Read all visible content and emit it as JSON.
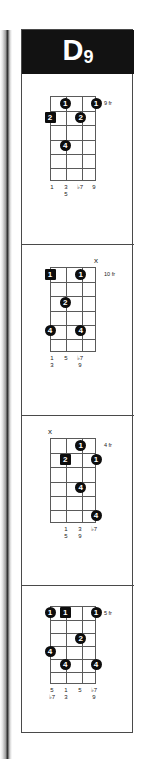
{
  "chord": {
    "root": "D",
    "extension": "9",
    "full_name": "D9"
  },
  "colors": {
    "banner_bg": "#121212",
    "banner_text": "#ffffff",
    "grid_line": "#5a5a5a",
    "dot_fill": "#0d0d0d",
    "dot_text": "#ffffff",
    "card_border": "#4a4a4a",
    "page_bg": "#ffffff"
  },
  "diagram_config": {
    "strings": 4,
    "frets": 6,
    "string_labels": [
      "4",
      "3",
      "2",
      "1"
    ]
  },
  "voicings": [
    {
      "id": "voicing-1",
      "fret_label": "9 fr",
      "top_markers": [
        "",
        "",
        "",
        ""
      ],
      "dots": [
        {
          "string": 2,
          "fret": 1,
          "finger": "1",
          "shape": "circle"
        },
        {
          "string": 4,
          "fret": 1,
          "finger": "1",
          "shape": "circle"
        },
        {
          "string": 1,
          "fret": 2,
          "finger": "2",
          "shape": "square"
        },
        {
          "string": 3,
          "fret": 2,
          "finger": "2",
          "shape": "circle"
        },
        {
          "string": 2,
          "fret": 4,
          "finger": "4",
          "shape": "circle"
        }
      ],
      "intervals": [
        {
          "top": "1",
          "bottom": ""
        },
        {
          "top": "3",
          "bottom": "5"
        },
        {
          "top": "♭7",
          "bottom": ""
        },
        {
          "top": "9",
          "bottom": ""
        }
      ]
    },
    {
      "id": "voicing-2",
      "fret_label": "10 fr",
      "top_markers": [
        "",
        "",
        "",
        "x"
      ],
      "dots": [
        {
          "string": 1,
          "fret": 1,
          "finger": "1",
          "shape": "square"
        },
        {
          "string": 3,
          "fret": 1,
          "finger": "1",
          "shape": "circle"
        },
        {
          "string": 2,
          "fret": 3,
          "finger": "2",
          "shape": "circle"
        },
        {
          "string": 1,
          "fret": 5,
          "finger": "4",
          "shape": "circle"
        },
        {
          "string": 3,
          "fret": 5,
          "finger": "4",
          "shape": "circle"
        }
      ],
      "intervals": [
        {
          "top": "1",
          "bottom": "3"
        },
        {
          "top": "5",
          "bottom": ""
        },
        {
          "top": "♭7",
          "bottom": "9"
        },
        {
          "top": "",
          "bottom": ""
        }
      ]
    },
    {
      "id": "voicing-3",
      "fret_label": "4 fr",
      "top_markers": [
        "x",
        "",
        "",
        ""
      ],
      "dots": [
        {
          "string": 3,
          "fret": 1,
          "finger": "1",
          "shape": "circle"
        },
        {
          "string": 2,
          "fret": 2,
          "finger": "2",
          "shape": "square"
        },
        {
          "string": 4,
          "fret": 2,
          "finger": "1",
          "shape": "circle"
        },
        {
          "string": 3,
          "fret": 4,
          "finger": "4",
          "shape": "circle"
        },
        {
          "string": 4,
          "fret": 6,
          "finger": "4",
          "shape": "circle"
        }
      ],
      "intervals": [
        {
          "top": "",
          "bottom": ""
        },
        {
          "top": "1",
          "bottom": "5"
        },
        {
          "top": "3",
          "bottom": "9"
        },
        {
          "top": "♭7",
          "bottom": ""
        }
      ]
    },
    {
      "id": "voicing-4",
      "fret_label": "5 fr",
      "top_markers": [
        "",
        "",
        "",
        ""
      ],
      "dots": [
        {
          "string": 1,
          "fret": 1,
          "finger": "1",
          "shape": "circle"
        },
        {
          "string": 2,
          "fret": 1,
          "finger": "1",
          "shape": "square"
        },
        {
          "string": 4,
          "fret": 1,
          "finger": "1",
          "shape": "circle"
        },
        {
          "string": 3,
          "fret": 3,
          "finger": "2",
          "shape": "circle"
        },
        {
          "string": 1,
          "fret": 4,
          "finger": "4",
          "shape": "circle"
        },
        {
          "string": 2,
          "fret": 5,
          "finger": "4",
          "shape": "circle"
        },
        {
          "string": 4,
          "fret": 5,
          "finger": "4",
          "shape": "circle"
        }
      ],
      "intervals": [
        {
          "top": "5",
          "bottom": "♭7"
        },
        {
          "top": "1",
          "bottom": "3"
        },
        {
          "top": "5",
          "bottom": ""
        },
        {
          "top": "♭7",
          "bottom": "9"
        }
      ]
    }
  ]
}
